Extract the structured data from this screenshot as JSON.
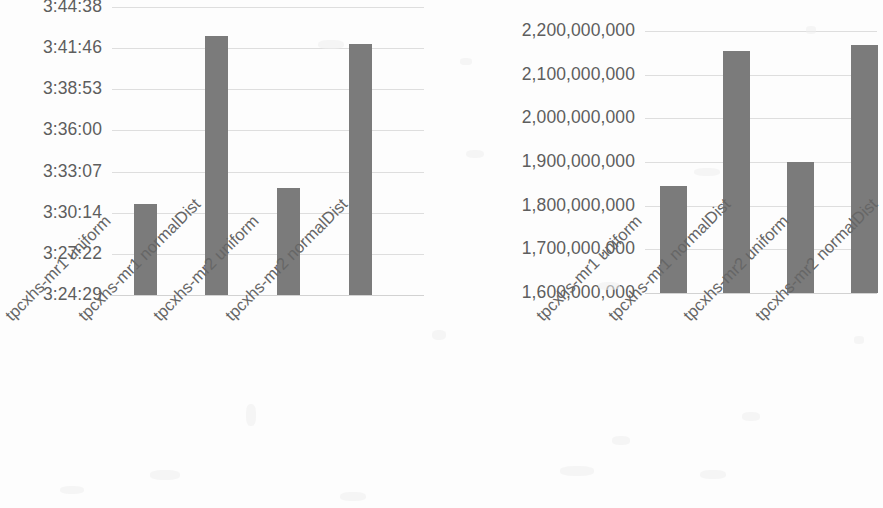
{
  "chart_data": [
    {
      "id": "left",
      "type": "bar",
      "title": "",
      "xlabel": "",
      "ylabel": "",
      "grid": true,
      "legend": "none",
      "categories": [
        "tpcxhs-mr1 uniform",
        "tpcxhs-mr1 normalDist",
        "tpcxhs-mr2 uniform",
        "tpcxhs-mr2 normalDist"
      ],
      "ytick_labels": [
        "3:44:38",
        "3:41:46",
        "3:38:53",
        "3:36:00",
        "3:33:07",
        "3:30:14",
        "3:27:22",
        "3:24:29"
      ],
      "ytick_seconds": [
        13478,
        13306,
        13133,
        12960,
        12787,
        12614,
        12442,
        12269
      ],
      "ylim_seconds": [
        12269,
        13478
      ],
      "values_display": [
        "3:30:53",
        "3:42:36",
        "3:31:57",
        "3:42:01"
      ],
      "values_seconds": [
        12653,
        13356,
        12717,
        13321
      ],
      "bar_color": "#7b7b7b"
    },
    {
      "id": "right",
      "type": "bar",
      "title": "",
      "xlabel": "",
      "ylabel": "",
      "grid": true,
      "legend": "none",
      "categories": [
        "tpcxhs-mr1 uniform",
        "tpcxhs-mr1 normalDist",
        "tpcxhs-mr2 uniform",
        "tpcxhs-mr2 normalDist"
      ],
      "ytick_labels": [
        "2,200,000,000",
        "2,100,000,000",
        "2,000,000,000",
        "1,900,000,000",
        "1,800,000,000",
        "1,700,000,000",
        "1,600,000,000"
      ],
      "ytick_values": [
        2200000000,
        2100000000,
        2000000000,
        1900000000,
        1800000000,
        1700000000,
        1600000000
      ],
      "ylim": [
        1600000000,
        2200000000
      ],
      "values": [
        1845000000,
        2155000000,
        1900000000,
        2168000000
      ],
      "bar_color": "#7b7b7b"
    }
  ],
  "colors": {
    "bar": "#7b7b7b",
    "gridline": "#dedede",
    "axis_text": "#5e5e5e",
    "category_text": "#666666",
    "background": "#fdfdfd"
  }
}
